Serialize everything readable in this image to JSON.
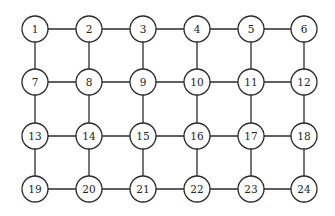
{
  "diagram": {
    "type": "grid-graph",
    "rows": 4,
    "cols": 6,
    "colors": {
      "stroke": "#2a2a2a",
      "fill": "#ffffff",
      "text": "#222222"
    },
    "layout": {
      "col_x": [
        35,
        89,
        143,
        197,
        251,
        304
      ],
      "row_y": [
        29,
        82,
        136,
        189
      ],
      "node_radius": 13
    },
    "nodes": [
      {
        "id": 1,
        "label": "1"
      },
      {
        "id": 2,
        "label": "2"
      },
      {
        "id": 3,
        "label": "3"
      },
      {
        "id": 4,
        "label": "4"
      },
      {
        "id": 5,
        "label": "5"
      },
      {
        "id": 6,
        "label": "6"
      },
      {
        "id": 7,
        "label": "7"
      },
      {
        "id": 8,
        "label": "8"
      },
      {
        "id": 9,
        "label": "9"
      },
      {
        "id": 10,
        "label": "10"
      },
      {
        "id": 11,
        "label": "11"
      },
      {
        "id": 12,
        "label": "12"
      },
      {
        "id": 13,
        "label": "13"
      },
      {
        "id": 14,
        "label": "14"
      },
      {
        "id": 15,
        "label": "15"
      },
      {
        "id": 16,
        "label": "16"
      },
      {
        "id": 17,
        "label": "17"
      },
      {
        "id": 18,
        "label": "18"
      },
      {
        "id": 19,
        "label": "19"
      },
      {
        "id": 20,
        "label": "20"
      },
      {
        "id": 21,
        "label": "21"
      },
      {
        "id": 22,
        "label": "22"
      },
      {
        "id": 23,
        "label": "23"
      },
      {
        "id": 24,
        "label": "24"
      }
    ],
    "edges": [
      [
        1,
        2
      ],
      [
        2,
        3
      ],
      [
        3,
        4
      ],
      [
        4,
        5
      ],
      [
        5,
        6
      ],
      [
        7,
        8
      ],
      [
        8,
        9
      ],
      [
        9,
        10
      ],
      [
        10,
        11
      ],
      [
        11,
        12
      ],
      [
        13,
        14
      ],
      [
        14,
        15
      ],
      [
        15,
        16
      ],
      [
        16,
        17
      ],
      [
        17,
        18
      ],
      [
        19,
        20
      ],
      [
        20,
        21
      ],
      [
        21,
        22
      ],
      [
        22,
        23
      ],
      [
        23,
        24
      ],
      [
        1,
        7
      ],
      [
        2,
        8
      ],
      [
        3,
        9
      ],
      [
        4,
        10
      ],
      [
        5,
        11
      ],
      [
        6,
        12
      ],
      [
        7,
        13
      ],
      [
        8,
        14
      ],
      [
        9,
        15
      ],
      [
        10,
        16
      ],
      [
        11,
        17
      ],
      [
        12,
        18
      ],
      [
        13,
        19
      ],
      [
        14,
        20
      ],
      [
        15,
        21
      ],
      [
        16,
        22
      ],
      [
        17,
        23
      ],
      [
        18,
        24
      ]
    ]
  }
}
